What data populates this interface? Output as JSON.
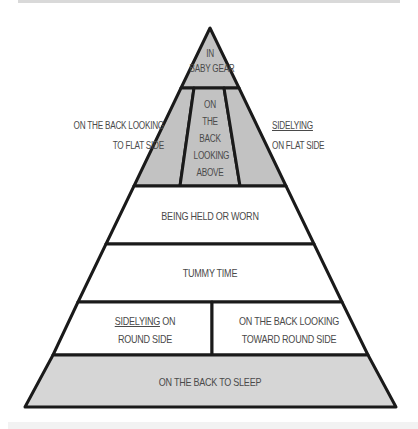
{
  "diagram": {
    "type": "pyramid",
    "colors": {
      "shaded_fill": "#c2c2c2",
      "bottom_fill": "#d6d6d6",
      "white_fill": "#ffffff",
      "outline": "#1a1a1a",
      "text": "#4a4a4a"
    },
    "levels": [
      {
        "id": "top",
        "lines": [
          "In",
          "Baby Gear"
        ],
        "fill": "shaded"
      },
      {
        "id": "upper-center",
        "lines": [
          "On",
          "the",
          "back",
          "looking",
          "above"
        ],
        "fill": "shaded"
      },
      {
        "id": "upper-left",
        "fill": "shaded"
      },
      {
        "id": "upper-right",
        "fill": "shaded"
      },
      {
        "id": "held",
        "lines": [
          "Being held or worn"
        ],
        "fill": "white"
      },
      {
        "id": "tummy",
        "lines": [
          "Tummy Time"
        ],
        "fill": "white"
      },
      {
        "id": "sidelying-round",
        "lines": [
          "Sidelying on",
          "round side"
        ],
        "underlined_word": "Sidelying",
        "fill": "white"
      },
      {
        "id": "back-toward-round",
        "lines": [
          "On the back looking",
          "toward round side"
        ],
        "fill": "white"
      },
      {
        "id": "sleep",
        "lines": [
          "On the back to sleep"
        ],
        "fill": "light"
      }
    ],
    "side_labels": {
      "left": [
        "On the back looking",
        "to flat side"
      ],
      "right": [
        "Sidelying",
        "on flat Side"
      ]
    }
  }
}
